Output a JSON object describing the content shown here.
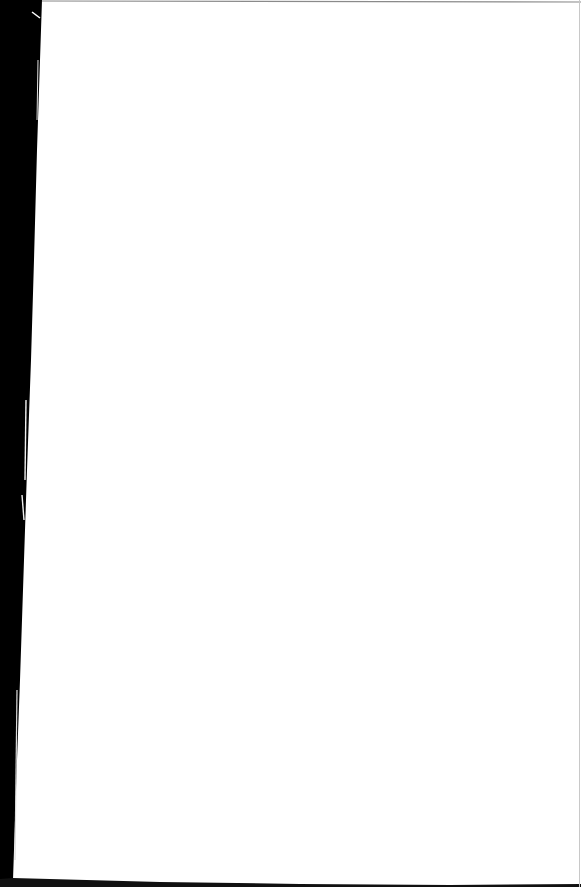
{
  "page": {
    "background_color": "#ffffff",
    "scanner_edge_color": "#000000",
    "border_line_color": "#9a9a9a",
    "content_text": ""
  }
}
